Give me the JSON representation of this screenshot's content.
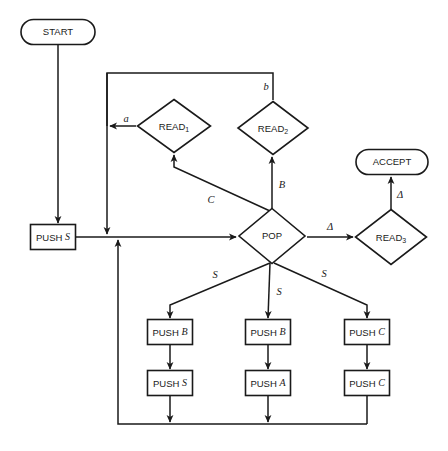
{
  "diagram": {
    "colors": {
      "stroke": "#1a1a1a",
      "fill": "#ffffff",
      "background": "#ffffff"
    },
    "nodes": [
      {
        "id": "start",
        "kind": "terminator",
        "label": "START",
        "cx": 58,
        "cy": 32,
        "w": 74,
        "h": 25
      },
      {
        "id": "accept",
        "kind": "terminator",
        "label": "ACCEPT",
        "cx": 392,
        "cy": 162,
        "w": 72,
        "h": 25
      },
      {
        "id": "read1",
        "kind": "decision",
        "label": "READ",
        "sub": "1",
        "cx": 174,
        "cy": 126,
        "w": 73,
        "h": 53
      },
      {
        "id": "read2",
        "kind": "decision",
        "label": "READ",
        "sub": "2",
        "cx": 273,
        "cy": 128,
        "w": 70,
        "h": 53
      },
      {
        "id": "read3",
        "kind": "decision",
        "label": "READ",
        "sub": "3",
        "cx": 391,
        "cy": 237,
        "w": 71,
        "h": 55
      },
      {
        "id": "pop",
        "kind": "decision",
        "label": "POP",
        "cx": 272,
        "cy": 236,
        "w": 66,
        "h": 55
      },
      {
        "id": "push_s_main",
        "kind": "process",
        "label": "PUSH",
        "arg": "S",
        "cx": 53,
        "cy": 237,
        "w": 45,
        "h": 25
      },
      {
        "id": "push_b_1",
        "kind": "process",
        "label": "PUSH",
        "arg": "B",
        "cx": 170,
        "cy": 332,
        "w": 45,
        "h": 25
      },
      {
        "id": "push_s_1",
        "kind": "process",
        "label": "PUSH",
        "arg": "S",
        "cx": 170,
        "cy": 383,
        "w": 45,
        "h": 25
      },
      {
        "id": "push_b_2",
        "kind": "process",
        "label": "PUSH",
        "arg": "B",
        "cx": 268,
        "cy": 332,
        "w": 45,
        "h": 25
      },
      {
        "id": "push_a_2",
        "kind": "process",
        "label": "PUSH",
        "arg": "A",
        "cx": 268,
        "cy": 383,
        "w": 45,
        "h": 25
      },
      {
        "id": "push_c_1",
        "kind": "process",
        "label": "PUSH",
        "arg": "C",
        "cx": 367,
        "cy": 332,
        "w": 45,
        "h": 25
      },
      {
        "id": "push_c_2",
        "kind": "process",
        "label": "PUSH",
        "arg": "C",
        "cx": 367,
        "cy": 383,
        "w": 45,
        "h": 25
      }
    ],
    "edge_labels": [
      {
        "id": "lbl-a",
        "text": "a",
        "x": 126,
        "y": 120
      },
      {
        "id": "lbl-b",
        "text": "b",
        "x": 266,
        "y": 88
      },
      {
        "id": "lbl-B",
        "text": "B",
        "x": 282,
        "y": 186
      },
      {
        "id": "lbl-C",
        "text": "C",
        "x": 211,
        "y": 201
      },
      {
        "id": "lbl-delta1",
        "text": "Δ",
        "x": 330,
        "y": 228
      },
      {
        "id": "lbl-delta2",
        "text": "Δ",
        "x": 400,
        "y": 196
      },
      {
        "id": "lbl-S-left",
        "text": "S",
        "x": 215,
        "y": 276
      },
      {
        "id": "lbl-S-mid",
        "text": "S",
        "x": 279,
        "y": 293
      },
      {
        "id": "lbl-S-right",
        "text": "S",
        "x": 324,
        "y": 275
      }
    ],
    "edges": [
      {
        "id": "start-to-push",
        "from": "start",
        "to": "push_s_main",
        "path": "M58,45 L58,223",
        "arrow": true
      },
      {
        "id": "push-to-pop",
        "from": "push_s_main",
        "to": "pop",
        "path": "M76,237 L236,237",
        "arrow": true
      },
      {
        "id": "pop-to-read2",
        "from": "pop",
        "to": "read2",
        "path": "M272,209 L272,157",
        "arrow": true
      },
      {
        "id": "pop-to-read1",
        "from": "pop",
        "to": "read1",
        "path": "M270,211 L174,167 L174,155",
        "arrow": true
      },
      {
        "id": "pop-to-read3",
        "from": "pop",
        "to": "read3",
        "path": "M307,237 L353,237",
        "arrow": true
      },
      {
        "id": "read3-to-accept",
        "from": "read3",
        "to": "accept",
        "path": "M391,209 L391,177",
        "arrow": true
      },
      {
        "id": "read2-top-loop",
        "from": "read2",
        "to": "feedback-bus",
        "path": "M273,100 L273,73 L107,73 L107,126",
        "arrow": false
      },
      {
        "id": "read1-to-bus",
        "from": "read1",
        "to": "feedback-bus",
        "path": "M136,126 L110,126",
        "arrow": true
      },
      {
        "id": "bus-to-push",
        "from": "feedback-bus",
        "to": "push_s_main",
        "path": "M107,73 L107,234",
        "arrow": true
      },
      {
        "id": "pop-branch-left",
        "from": "pop",
        "to": "push_b_1",
        "path": "M270,263 L170,305 L170,318",
        "arrow": true
      },
      {
        "id": "pop-branch-mid",
        "from": "pop",
        "to": "push_b_2",
        "path": "M270,263 L268,318",
        "arrow": true
      },
      {
        "id": "pop-branch-right",
        "from": "pop",
        "to": "push_c_1",
        "path": "M274,263 L367,305 L367,318",
        "arrow": true
      },
      {
        "id": "pb1-to-ps1",
        "from": "push_b_1",
        "to": "push_s_1",
        "path": "M170,345 L170,369",
        "arrow": true
      },
      {
        "id": "pb2-to-pa2",
        "from": "push_b_2",
        "to": "push_a_2",
        "path": "M268,345 L268,369",
        "arrow": true
      },
      {
        "id": "pc1-to-pc2",
        "from": "push_c_1",
        "to": "push_c_2",
        "path": "M367,345 L367,369",
        "arrow": true
      },
      {
        "id": "ps1-to-return",
        "from": "push_s_1",
        "to": "return-bus",
        "path": "M170,396 L170,422",
        "arrow": true
      },
      {
        "id": "pa2-to-return",
        "from": "push_a_2",
        "to": "return-bus",
        "path": "M268,396 L268,422",
        "arrow": true
      },
      {
        "id": "pc2-to-return",
        "from": "push_c_2",
        "to": "return-bus",
        "path": "M367,396 L367,424",
        "arrow": false
      },
      {
        "id": "return-bus",
        "from": "return-bus",
        "to": "push-to-pop",
        "path": "M367,424 L118,424 L118,240",
        "arrow": true
      }
    ]
  }
}
